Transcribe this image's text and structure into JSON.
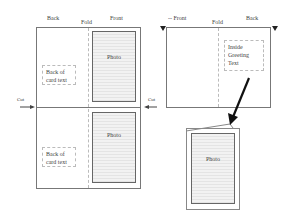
{
  "left_diagram": {
    "labels": {
      "back": "Back",
      "fold": "Fold",
      "front": "Front",
      "cut_left": "Cut",
      "cut_right": "Cut"
    },
    "top_card": {
      "photo_label": "Photo",
      "back_text": "Back of card text"
    },
    "bottom_card": {
      "photo_label": "Photo",
      "back_text": "Back of card text"
    }
  },
  "right_diagram": {
    "labels": {
      "front": "-- Front",
      "fold": "Fold",
      "back": "Back"
    },
    "inside_text": "Inside Greeting Text",
    "folded_card": {
      "photo_label": "Photo"
    }
  },
  "colors": {
    "stroke": "#777777",
    "dashed": "#bbbbbb",
    "arrow": "#111111"
  }
}
